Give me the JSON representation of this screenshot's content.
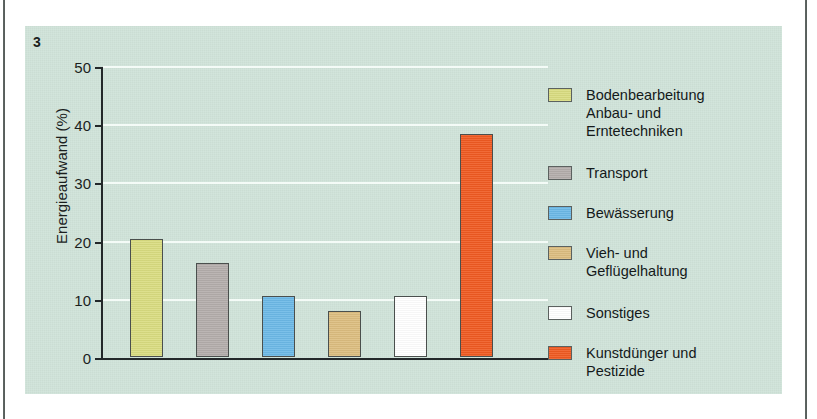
{
  "figure": {
    "number": "3",
    "panel_bg": "#cfe3d9"
  },
  "chart_data": {
    "type": "bar",
    "title": "",
    "subtitle": "",
    "xlabel": "",
    "ylabel": "Energieaufwand (%)",
    "ylim": [
      0,
      50
    ],
    "yticks": [
      0,
      10,
      20,
      30,
      40,
      50
    ],
    "ytick_labels": [
      "0",
      "10",
      "20",
      "30",
      "40",
      "50"
    ],
    "grid": "horizontal",
    "grid_color": "#f4fbf7",
    "legend_position": "right",
    "categories": [
      "Bodenbearbeitung\nAnbau- und\nErntetechniken",
      "Transport",
      "Bewässerung",
      "Vieh- und\nGeflügelhaltung",
      "Sonstiges",
      "Kunstdünger und\nPestizide"
    ],
    "values": [
      20.3,
      16.1,
      10.4,
      7.9,
      10.5,
      38.3
    ],
    "colors": [
      "#d9dc80",
      "#b3adab",
      "#6cb9e7",
      "#dcbd7f",
      "#ffffff",
      "#ef5a21"
    ],
    "series": [
      {
        "name": "Energieaufwand (%)",
        "values": [
          20.3,
          16.1,
          10.4,
          7.9,
          10.5,
          38.3
        ]
      }
    ]
  },
  "legend": {
    "items": [
      {
        "label": "Bodenbearbeitung\nAnbau- und\nErntetechniken",
        "color": "#d9dc80",
        "top": 32
      },
      {
        "label": "Transport",
        "color": "#b3adab",
        "top": 110
      },
      {
        "label": "Bewässerung",
        "color": "#6cb9e7",
        "top": 150
      },
      {
        "label": "Vieh- und\nGeflügelhaltung",
        "color": "#dcbd7f",
        "top": 190
      },
      {
        "label": "Sonstiges",
        "color": "#ffffff",
        "top": 250
      },
      {
        "label": "Kunstdünger und\nPestizide",
        "color": "#ef5a21",
        "top": 290
      }
    ]
  }
}
